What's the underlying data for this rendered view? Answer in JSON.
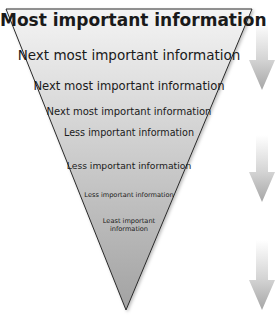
{
  "diagram": {
    "levels": [
      {
        "label": "Most important information"
      },
      {
        "label": "Next most important information"
      },
      {
        "label": "Next most important information"
      },
      {
        "label": "Next most important information"
      },
      {
        "label": "Less important information"
      },
      {
        "label": "Less important information"
      },
      {
        "label": "Less important information"
      },
      {
        "label": "Least important information"
      }
    ],
    "arrows": [
      {
        "name": "arrow-1",
        "direction": "down"
      },
      {
        "name": "arrow-2",
        "direction": "down"
      },
      {
        "name": "arrow-3",
        "direction": "down"
      }
    ],
    "colors": {
      "triangle_top": "#f2f2f2",
      "triangle_bottom": "#a4a4a4",
      "outline": "#2a2a2a",
      "arrow_top": "#ffffff",
      "arrow_bottom": "#a8a8a8"
    }
  }
}
